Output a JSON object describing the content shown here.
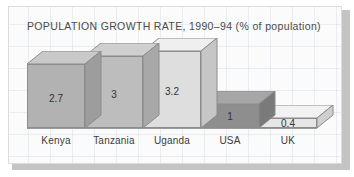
{
  "chart": {
    "title": "POPULATION GROWTH RATE, 1990–94 (% of population)"
  },
  "chart_data": {
    "type": "bar",
    "title": "POPULATION GROWTH RATE, 1990–94 (% of population)",
    "subtitle": "",
    "xlabel": "",
    "ylabel": "% of population",
    "categories": [
      "Kenya",
      "Tanzania",
      "Uganda",
      "USA",
      "UK"
    ],
    "values": [
      2.7,
      3,
      3.2,
      1,
      0.4
    ],
    "value_labels": [
      "2.7",
      "3",
      "3.2",
      "1",
      "0.4"
    ],
    "ylim": [
      0,
      3.2
    ],
    "grid": true,
    "legend": false,
    "style": "3d-isometric-bars",
    "bar_colors": [
      "#b2b2b2",
      "#bdbdbd",
      "#dedede",
      "#8e8e8e",
      "#e6e6e6"
    ],
    "bar_top_colors": [
      "#c9c9c9",
      "#cfcfcf",
      "#efefef",
      "#a6a6a6",
      "#f2f2f2"
    ],
    "bar_side_colors": [
      "#9d9d9d",
      "#a8a8a8",
      "#c6c6c6",
      "#7a7a7a",
      "#cfcfcf"
    ]
  },
  "bars": [
    {
      "category": "Kenya",
      "label": "2.7",
      "left": 18,
      "width": 58,
      "height": 64
    },
    {
      "category": "Tanzania",
      "label": "3",
      "left": 76,
      "width": 58,
      "height": 72
    },
    {
      "category": "Uganda",
      "label": "3.2",
      "left": 134,
      "width": 58,
      "height": 77
    },
    {
      "category": "USA",
      "label": "1",
      "left": 192,
      "width": 58,
      "height": 24
    },
    {
      "category": "UK",
      "label": "0.4",
      "left": 250,
      "width": 58,
      "height": 10
    }
  ]
}
